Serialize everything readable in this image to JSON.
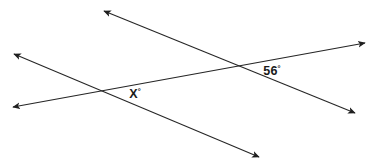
{
  "diagram": {
    "type": "geometry-angle-diagram",
    "canvas": {
      "width": 371,
      "height": 167,
      "background": "#ffffff"
    },
    "stroke": {
      "color": "#262626",
      "width": 1.1
    },
    "labels": {
      "known_angle": {
        "value": "56",
        "degree": "°",
        "text": "56°",
        "x": 272,
        "y": 75
      },
      "unknown_angle": {
        "value": "X",
        "degree": "°",
        "text": "X°",
        "x": 135,
        "y": 98
      }
    },
    "lines": [
      {
        "name": "line-a-transversal-upper",
        "from": {
          "x": 104,
          "y": 11
        },
        "to": {
          "x": 355,
          "y": 113
        },
        "arrow_start": true,
        "arrow_end": true
      },
      {
        "name": "line-b-transversal-lower",
        "from": {
          "x": 14,
          "y": 54
        },
        "to": {
          "x": 259,
          "y": 157
        },
        "arrow_start": true,
        "arrow_end": true
      },
      {
        "name": "line-c-base",
        "from": {
          "x": 13,
          "y": 107
        },
        "to": {
          "x": 365,
          "y": 43
        },
        "arrow_start": true,
        "arrow_end": true
      }
    ],
    "intersections": [
      {
        "name": "left-intersection",
        "x": 103,
        "y": 89
      },
      {
        "name": "right-intersection",
        "x": 240,
        "y": 67
      }
    ]
  }
}
